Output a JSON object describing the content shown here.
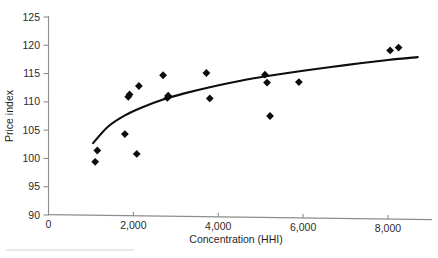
{
  "chart_data": {
    "type": "scatter",
    "title": "",
    "subtitle": "",
    "xlabel": "Concentration (HHI)",
    "ylabel": "Price index",
    "xlim": [
      0,
      8800
    ],
    "ylim": [
      90,
      125
    ],
    "xticks": [
      0,
      2000,
      4000,
      6000,
      8000
    ],
    "xtick_labels": [
      "0",
      "2,000",
      "4,000",
      "6,000",
      "8,000"
    ],
    "yticks": [
      90,
      95,
      100,
      105,
      110,
      115,
      120,
      125
    ],
    "ytick_labels": [
      "90",
      "95",
      "100",
      "105",
      "110",
      "115",
      "120",
      "125"
    ],
    "grid": false,
    "legend": null,
    "marker_style": "filled-diamond",
    "marker_color": "#0d0d0d",
    "points": [
      {
        "x": 1100,
        "y": 99.4
      },
      {
        "x": 1150,
        "y": 101.4
      },
      {
        "x": 1800,
        "y": 104.3
      },
      {
        "x": 1880,
        "y": 110.9
      },
      {
        "x": 1910,
        "y": 111.3
      },
      {
        "x": 2080,
        "y": 100.8
      },
      {
        "x": 2130,
        "y": 112.8
      },
      {
        "x": 2700,
        "y": 114.7
      },
      {
        "x": 2800,
        "y": 110.7
      },
      {
        "x": 2820,
        "y": 111.1
      },
      {
        "x": 3720,
        "y": 115.1
      },
      {
        "x": 3800,
        "y": 110.6
      },
      {
        "x": 5100,
        "y": 114.8
      },
      {
        "x": 5150,
        "y": 113.4
      },
      {
        "x": 5220,
        "y": 107.5
      },
      {
        "x": 5900,
        "y": 113.5
      },
      {
        "x": 8050,
        "y": 119.1
      },
      {
        "x": 8250,
        "y": 119.6
      }
    ],
    "trend_line": {
      "type": "logarithmic-fit",
      "color": "#0d0d0d",
      "points": [
        {
          "x": 1050,
          "y": 102.7
        },
        {
          "x": 1400,
          "y": 105.6
        },
        {
          "x": 1800,
          "y": 107.6
        },
        {
          "x": 2200,
          "y": 109.0
        },
        {
          "x": 2700,
          "y": 110.4
        },
        {
          "x": 3200,
          "y": 111.5
        },
        {
          "x": 3800,
          "y": 112.6
        },
        {
          "x": 4500,
          "y": 113.7
        },
        {
          "x": 5200,
          "y": 114.6
        },
        {
          "x": 6000,
          "y": 115.5
        },
        {
          "x": 7000,
          "y": 116.5
        },
        {
          "x": 8000,
          "y": 117.4
        },
        {
          "x": 8700,
          "y": 117.9
        }
      ]
    }
  }
}
